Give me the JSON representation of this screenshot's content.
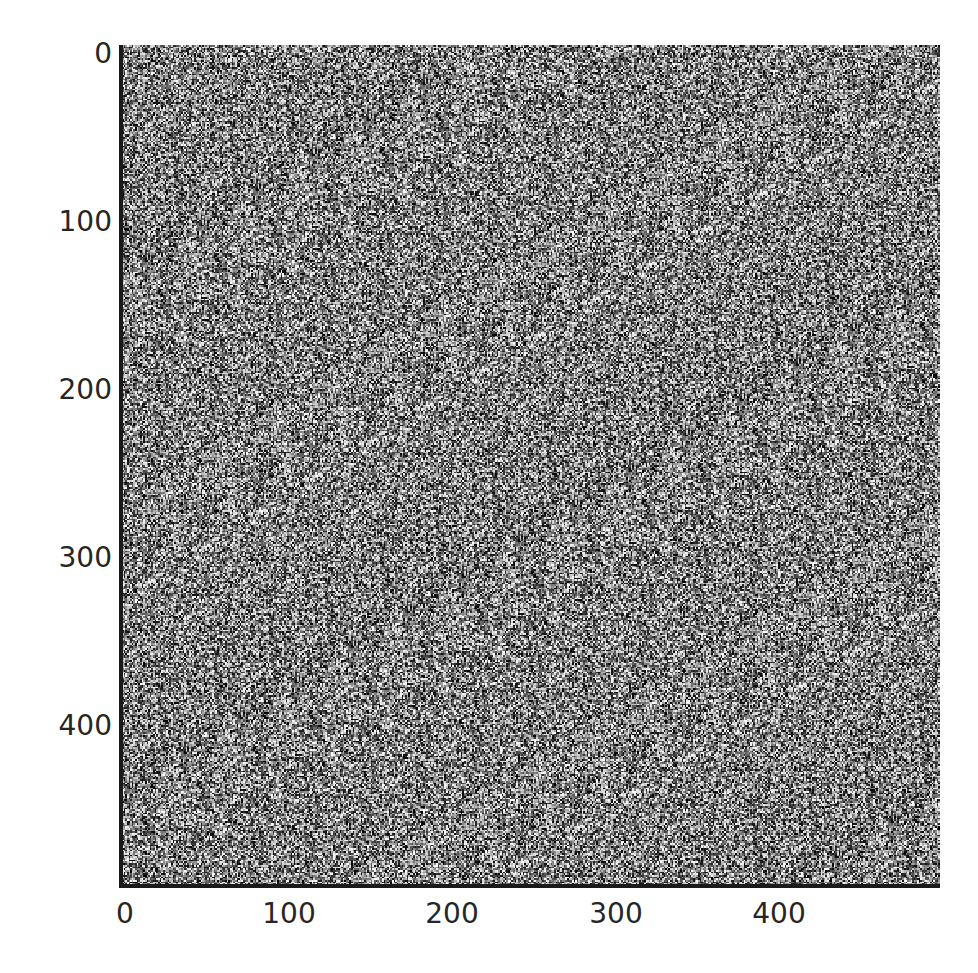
{
  "chart_data": {
    "type": "heatmap",
    "title": "",
    "colormap": "gray",
    "width": 500,
    "height": 500,
    "xlabel": "",
    "ylabel": "",
    "xlim": [
      0,
      500
    ],
    "ylim": [
      500,
      0
    ],
    "x_ticks": [
      0,
      100,
      200,
      300,
      400
    ],
    "y_ticks": [
      0,
      100,
      200,
      300,
      400
    ],
    "x_tick_labels": [
      "0",
      "100",
      "200",
      "300",
      "400"
    ],
    "y_tick_labels": [
      "0",
      "100",
      "200",
      "300",
      "400"
    ],
    "grid": false,
    "legend": null,
    "value_range": [
      0,
      255
    ]
  },
  "axes": {
    "x_labels": [
      "0",
      "100",
      "200",
      "300",
      "400"
    ],
    "y_labels": [
      "0",
      "100",
      "200",
      "300",
      "400"
    ]
  }
}
